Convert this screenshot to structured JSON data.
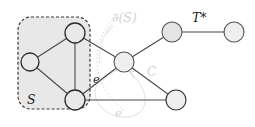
{
  "figure": {
    "type": "graph-diagram",
    "width": 255,
    "height": 127,
    "background": "#ffffff"
  },
  "labels": {
    "set_S": "S",
    "boundary": "∂(S)",
    "tree": "T*",
    "edge_e": "e",
    "edge_e_prime": "e′",
    "cycle_C": "C"
  },
  "colors": {
    "edge_stroke": "#4a4a4a",
    "node_stroke": "#2b2b2b",
    "node_fill_inside": "#e9e9e9",
    "node_fill_outside": "#e4e4e4",
    "region_fill": "#e8e8e8",
    "region_dash": "#3a3a3a",
    "faint": "#d2d2d2",
    "label_text": "#1a1a1a"
  },
  "region_S": {
    "x": 18,
    "y": 17,
    "width": 72,
    "height": 92,
    "corner_radius": 13,
    "dash_pattern": "3,2"
  },
  "nodes": [
    {
      "id": "s_top",
      "label": "",
      "cx": 75,
      "cy": 33,
      "r": 10,
      "in_S": true
    },
    {
      "id": "s_left",
      "label": "",
      "cx": 30,
      "cy": 62,
      "r": 9,
      "in_S": true
    },
    {
      "id": "s_bottom",
      "label": "",
      "cx": 75,
      "cy": 100,
      "r": 10,
      "in_S": true
    },
    {
      "id": "mid",
      "label": "",
      "cx": 124,
      "cy": 62,
      "r": 10,
      "in_S": false
    },
    {
      "id": "up_right",
      "label": "",
      "cx": 172,
      "cy": 32,
      "r": 10,
      "in_S": false
    },
    {
      "id": "far_right",
      "label": "",
      "cx": 234,
      "cy": 32,
      "r": 10,
      "in_S": false
    },
    {
      "id": "low_right",
      "label": "",
      "cx": 176,
      "cy": 100,
      "r": 10,
      "in_S": false
    }
  ],
  "edges": [
    {
      "from": "s_left",
      "to": "s_top",
      "style": "solid"
    },
    {
      "from": "s_left",
      "to": "s_bottom",
      "style": "solid"
    },
    {
      "from": "s_top",
      "to": "s_bottom",
      "style": "solid"
    },
    {
      "from": "s_top",
      "to": "mid",
      "style": "solid",
      "label": "e"
    },
    {
      "from": "s_bottom",
      "to": "mid",
      "style": "solid"
    },
    {
      "from": "s_bottom",
      "to": "low_right",
      "style": "solid",
      "label": "e′"
    },
    {
      "from": "mid",
      "to": "up_right",
      "style": "solid"
    },
    {
      "from": "mid",
      "to": "low_right",
      "style": "solid"
    },
    {
      "from": "up_right",
      "to": "far_right",
      "style": "solid",
      "label": "T*"
    }
  ],
  "annotations": [
    {
      "name": "boundary-curve",
      "text": "∂(S)",
      "x": 128,
      "y": 21,
      "faint": true
    },
    {
      "name": "cycle-curve",
      "text": "C",
      "x": 152,
      "y": 73,
      "faint": true
    },
    {
      "name": "edge-e",
      "text": "e",
      "x": 97,
      "y": 81,
      "faint": false
    },
    {
      "name": "edge-e-prime",
      "text": "e′",
      "x": 120,
      "y": 113,
      "faint": true
    },
    {
      "name": "set-S",
      "text": "S",
      "x": 30,
      "y": 101,
      "faint": false
    },
    {
      "name": "tree-T",
      "text": "T*",
      "x": 198,
      "y": 21,
      "faint": false
    }
  ]
}
